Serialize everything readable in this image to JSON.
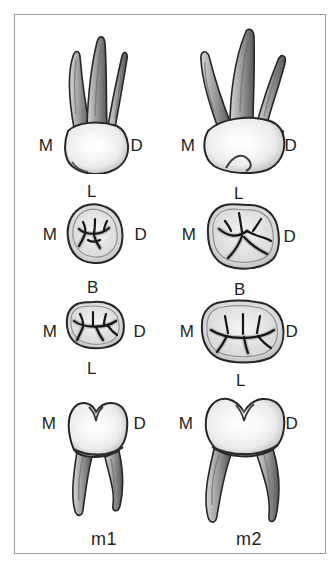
{
  "figure": {
    "colors": {
      "background": "#ffffff",
      "border": "#9a9a9a",
      "ink": "#1f1f1f"
    },
    "columns": [
      {
        "name": "m1",
        "caption": "m1",
        "upper_buccal": {
          "left": "M",
          "right": "D"
        },
        "upper_occlusal": {
          "top": "L",
          "left": "M",
          "right": "D",
          "bottom": "B"
        },
        "lower_occlusal": {
          "left": "M",
          "right": "D",
          "bottom": "L"
        },
        "lower_buccal": {
          "left": "M",
          "right": "D"
        }
      },
      {
        "name": "m2",
        "caption": "m2",
        "upper_buccal": {
          "left": "M",
          "right": "D"
        },
        "upper_occlusal": {
          "top": "L",
          "left": "M",
          "right": "D",
          "bottom": "B"
        },
        "lower_occlusal": {
          "left": "M",
          "right": "D",
          "bottom": "L"
        },
        "lower_buccal": {
          "left": "M",
          "right": "D"
        }
      }
    ]
  }
}
